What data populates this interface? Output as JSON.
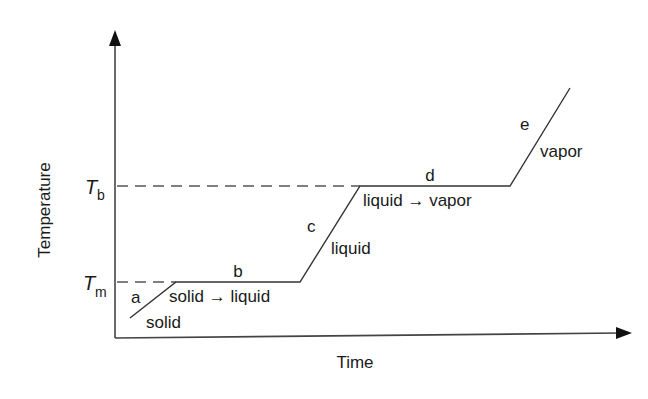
{
  "diagram": {
    "type": "heating-curve",
    "axes": {
      "x_label": "Time",
      "y_label": "Temperature"
    },
    "reference_lines": {
      "melting": {
        "symbol": "T",
        "subscript": "m"
      },
      "boiling": {
        "symbol": "T",
        "subscript": "b"
      }
    },
    "segments": [
      {
        "id": "a",
        "phase": "solid",
        "kind": "heating"
      },
      {
        "id": "b",
        "phase": "solid → liquid",
        "kind": "plateau"
      },
      {
        "id": "c",
        "phase": "liquid",
        "kind": "heating"
      },
      {
        "id": "d",
        "phase": "liquid → vapor",
        "kind": "plateau"
      },
      {
        "id": "e",
        "phase": "vapor",
        "kind": "heating"
      }
    ],
    "colors": {
      "line": "#333333",
      "text": "#1a1a1a",
      "background": "#ffffff"
    }
  }
}
